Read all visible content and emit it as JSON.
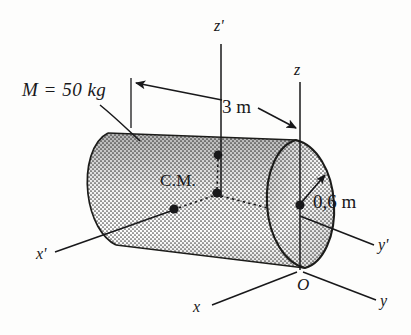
{
  "figure": {
    "background_color": "#fdfdfc",
    "ink_color": "#18181a"
  },
  "labels": {
    "mass": "M = 50 kg",
    "mass_symbol": "M",
    "mass_equals": "=",
    "mass_value": "50 kg",
    "length_dimension": "3 m",
    "radius_dimension": "0,6 m",
    "center_of_mass": "C.M.",
    "origin": "O"
  },
  "axes": [
    {
      "name": "z-prime",
      "label": "z'",
      "system": "center-of-mass"
    },
    {
      "name": "x-prime",
      "label": "x'",
      "system": "center-of-mass"
    },
    {
      "name": "y-prime",
      "label": "y'",
      "system": "center-of-mass"
    },
    {
      "name": "z",
      "label": "z",
      "system": "origin"
    },
    {
      "name": "x",
      "label": "x",
      "system": "origin"
    },
    {
      "name": "y",
      "label": "y",
      "system": "origin"
    }
  ],
  "quantities": {
    "mass_kg": 50,
    "length_m": 3,
    "radius_m": 0.6
  },
  "body": {
    "shape": "cylinder",
    "fill": "stippled-gray",
    "fill_color": "#b8b8b4"
  }
}
